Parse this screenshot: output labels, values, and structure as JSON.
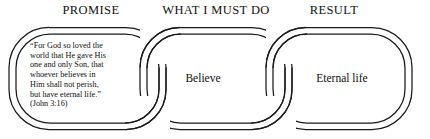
{
  "diagram": {
    "title_row": {
      "promise": "PROMISE",
      "what_i_must_do": "WHAT I MUST DO",
      "result": "RESULT"
    },
    "links": [
      {
        "id": "promise",
        "header": "PROMISE",
        "text": "“For God so loved the\nworld that He gave His\none and only Son, that\nwhoever believes in\nHim shall not perish,\nbut have eternal life.”\n(John 3:16)"
      },
      {
        "id": "what-i-must-do",
        "header": "WHAT I MUST DO",
        "text": "Believe"
      },
      {
        "id": "result",
        "header": "RESULT",
        "text": "Eternal life"
      }
    ],
    "colors": {
      "background": "#ffffff",
      "stroke": "#1a1a1a",
      "text": "#111111"
    }
  }
}
